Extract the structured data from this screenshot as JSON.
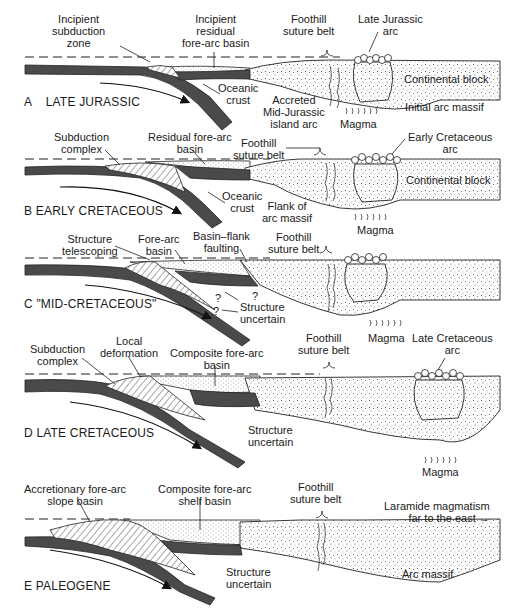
{
  "figure": {
    "type": "geologic-cross-section-sequence",
    "panels": [
      {
        "id": "A",
        "title": "A    LATE JURASSIC",
        "labels": {
          "incipient_subduction_zone": "Incipient\nsubduction\nzone",
          "incipient_residual_forearc_basin": "Incipient\nresidual\nfore-arc basin",
          "foothill_suture_belt": "Foothill\nsuture belt",
          "arc": "Late Jurassic\narc",
          "oceanic_crust": "Oceanic\ncrust",
          "accreted_island_arc": "Accreted\nMid-Jurassic\nisland arc",
          "magma": "Magma",
          "continental_block": "Continental block",
          "initial_arc_massif": "Initial arc massif"
        }
      },
      {
        "id": "B",
        "title": "B EARLY CRETACEOUS",
        "labels": {
          "subduction_complex": "Subduction\ncomplex",
          "residual_forearc_basin": "Residual fore-arc\nbasin",
          "foothill_suture_belt": "Foothill\nsuture belt",
          "arc": "Early Cretaceous\narc",
          "oceanic_crust": "Oceanic\ncrust",
          "continental_block": "Continental block",
          "flank_of_arc_massif": "Flank of\narc massif",
          "magma": "Magma"
        }
      },
      {
        "id": "C",
        "title": "C \"MID-CRETACEOUS\"",
        "labels": {
          "structure_telescoping": "Structure\ntelescoping",
          "forearc_basin": "Fore-arc\nbasin",
          "basin_flank_faulting": "Basin–flank\nfaulting",
          "foothill_suture_belt": "Foothill\nsuture belt",
          "structure_uncertain": "Structure\nuncertain",
          "question_mark": "?",
          "magma": "Magma"
        }
      },
      {
        "id": "D",
        "title": "D LATE CRETACEOUS",
        "labels": {
          "subduction_complex": "Subduction\ncomplex",
          "local_deformation": "Local\ndeformation",
          "composite_forearc_basin": "Composite fore-arc\nbasin",
          "foothill_suture_belt": "Foothill\nsuture belt",
          "arc": "Late Cretaceous\narc",
          "structure_uncertain": "Structure\nuncertain",
          "magma": "Magma"
        }
      },
      {
        "id": "E",
        "title": "E PALEOGENE",
        "labels": {
          "accretionary_slope_basin": "Accretionary fore-arc\nslope basin",
          "composite_shelf_basin": "Composite fore-arc\nshelf basin",
          "foothill_suture_belt": "Foothill\nsuture belt",
          "laramide": "Laramide magmatism\nfar to the east →",
          "structure_uncertain": "Structure\nuncertain",
          "arc_massif": "Arc massif"
        }
      }
    ]
  }
}
